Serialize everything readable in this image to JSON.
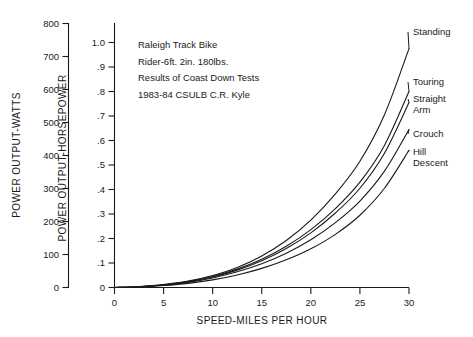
{
  "chart_data": {
    "type": "line",
    "title": "",
    "annotation_lines": [
      "Raleigh Track Bike",
      "Rider-6ft. 2in. 180lbs.",
      "Results of Coast Down Tests",
      "1983-84 CSULB C.R. Kyle"
    ],
    "xlabel": "SPEED-MILES PER HOUR",
    "ylabel_left": "POWER OUTPUT-WATTS",
    "ylabel_right": "POWER OUTPUT-HORSEPOWER",
    "xlim": [
      0,
      30
    ],
    "ylim_watts": [
      0,
      800
    ],
    "ylim_hp": [
      0,
      1.0
    ],
    "grid": false,
    "legend_position": "right-inline-labels",
    "xticks": [
      0,
      5,
      10,
      15,
      20,
      25,
      30
    ],
    "xticklabels": [
      "0",
      "5",
      "10",
      "15",
      "20",
      "25",
      "30"
    ],
    "yticks_watts": [
      0,
      100,
      200,
      300,
      400,
      500,
      600,
      700,
      800
    ],
    "yticklabels_watts": [
      "0",
      "100",
      "200",
      "300",
      "400",
      "500",
      "600",
      "700",
      "800"
    ],
    "yticks_hp": [
      0,
      0.1,
      0.2,
      0.3,
      0.4,
      0.5,
      0.6,
      0.7,
      0.8,
      0.9,
      1.0
    ],
    "yticklabels_hp": [
      "0",
      ".1",
      ".2",
      ".3",
      ".4",
      ".5",
      ".6",
      ".7",
      ".8",
      ".9",
      "1.0"
    ],
    "x": [
      0,
      2.5,
      5,
      7.5,
      10,
      12.5,
      15,
      17.5,
      20,
      22.5,
      25,
      27.5,
      30
    ],
    "series": [
      {
        "name": "Standing",
        "label": "Standing",
        "unit": "horsepower",
        "values": [
          0.0,
          0.004,
          0.012,
          0.026,
          0.049,
          0.082,
          0.129,
          0.192,
          0.275,
          0.382,
          0.515,
          0.705,
          0.975
        ]
      },
      {
        "name": "Touring",
        "label": "Touring",
        "unit": "horsepower",
        "values": [
          0.0,
          0.003,
          0.011,
          0.024,
          0.045,
          0.075,
          0.115,
          0.168,
          0.236,
          0.322,
          0.43,
          0.58,
          0.8
        ]
      },
      {
        "name": "Straight Arm",
        "label": "Straight Arm",
        "label_line1": "Straight",
        "label_line2": "Arm",
        "unit": "horsepower",
        "values": [
          0.0,
          0.003,
          0.01,
          0.023,
          0.043,
          0.071,
          0.109,
          0.159,
          0.223,
          0.304,
          0.405,
          0.548,
          0.755
        ]
      },
      {
        "name": "Crouch",
        "label": "Crouch",
        "unit": "horsepower",
        "values": [
          0.0,
          0.003,
          0.01,
          0.021,
          0.039,
          0.064,
          0.097,
          0.14,
          0.195,
          0.265,
          0.353,
          0.475,
          0.645
        ]
      },
      {
        "name": "Hill Descent",
        "label": "Hill Descent",
        "label_line1": "Hill",
        "label_line2": "Descent",
        "unit": "horsepower",
        "values": [
          0.0,
          0.002,
          0.008,
          0.017,
          0.031,
          0.051,
          0.078,
          0.113,
          0.158,
          0.217,
          0.295,
          0.405,
          0.56
        ]
      }
    ],
    "colors": {
      "ink": "#1a1a1a",
      "background": "#ffffff"
    }
  }
}
